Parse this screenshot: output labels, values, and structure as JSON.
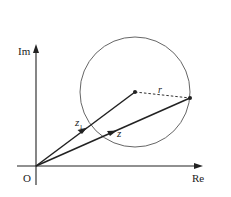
{
  "diagram": {
    "axes": {
      "imag_label": "Im",
      "real_label": "Re",
      "origin_label": "O"
    },
    "vectors": [
      {
        "name": "z1",
        "label_main": "z",
        "label_sub": "1",
        "from": "O",
        "to": "circle-center"
      },
      {
        "name": "z",
        "label_main": "z",
        "label_sub": "",
        "from": "O",
        "to": "point-on-circle"
      }
    ],
    "radius_label": "r",
    "colors": {
      "line": "#222222",
      "circle": "#555555",
      "background": "#ffffff"
    }
  }
}
